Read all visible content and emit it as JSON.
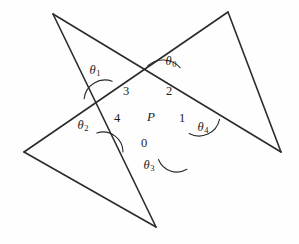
{
  "figure": {
    "kind": "pentagram-angle-diagram",
    "background_color": "#fefefe",
    "stroke_color": "#2b2b2b",
    "label_color": "#1c1c1c",
    "center": {
      "label": "P",
      "x": 151,
      "y": 116
    },
    "vertices": [
      {
        "name": "top-left-point",
        "x": 53,
        "y": 14
      },
      {
        "name": "top-right-point",
        "x": 228,
        "y": 12
      },
      {
        "name": "right-point",
        "x": 281,
        "y": 152
      },
      {
        "name": "bottom-point",
        "x": 156,
        "y": 227
      },
      {
        "name": "left-point",
        "x": 24,
        "y": 152
      }
    ],
    "edges": [
      {
        "name": "edge-topleft-to-right",
        "from": 0,
        "to": 2
      },
      {
        "name": "edge-right-to-topright",
        "from": 2,
        "to": 1
      },
      {
        "name": "edge-topright-to-left",
        "from": 1,
        "to": 4
      },
      {
        "name": "edge-left-to-bottom",
        "from": 4,
        "to": 3
      },
      {
        "name": "edge-bottom-to-topleft",
        "from": 3,
        "to": 0
      }
    ],
    "angle_arcs": [
      {
        "name": "arc-theta-0",
        "cx": 163,
        "cy": 83,
        "r": 23,
        "start_deg": 228,
        "end_deg": 318
      },
      {
        "name": "arc-theta-1",
        "cx": 105,
        "cy": 101,
        "r": 21,
        "start_deg": 186,
        "end_deg": 290
      },
      {
        "name": "arc-theta-2",
        "cx": 103,
        "cy": 152,
        "r": 20,
        "start_deg": 252,
        "end_deg": 360
      },
      {
        "name": "arc-theta-3",
        "cx": 177,
        "cy": 152,
        "r": 20,
        "start_deg": 60,
        "end_deg": 158
      },
      {
        "name": "arc-theta-4",
        "cx": 199,
        "cy": 115,
        "r": 21,
        "start_deg": 12,
        "end_deg": 118
      }
    ],
    "theta_labels": [
      {
        "name": "theta-0-label",
        "symbol": "θ",
        "subscript": "0",
        "x": 171,
        "y": 62
      },
      {
        "name": "theta-1-label",
        "symbol": "θ",
        "subscript": "1",
        "x": 95,
        "y": 71
      },
      {
        "name": "theta-2-label",
        "symbol": "θ",
        "subscript": "2",
        "x": 83,
        "y": 126
      },
      {
        "name": "theta-3-label",
        "symbol": "θ",
        "subscript": "3",
        "x": 149,
        "y": 166
      },
      {
        "name": "theta-4-label",
        "symbol": "θ",
        "subscript": "4",
        "x": 203,
        "y": 128
      }
    ],
    "region_labels": [
      {
        "name": "region-label-0",
        "text": "0",
        "x": 144,
        "y": 143
      },
      {
        "name": "region-label-1",
        "text": "1",
        "x": 182,
        "y": 118
      },
      {
        "name": "region-label-2",
        "text": "2",
        "x": 169,
        "y": 91
      },
      {
        "name": "region-label-3",
        "text": "3",
        "x": 126,
        "y": 91
      },
      {
        "name": "region-label-4",
        "text": "4",
        "x": 117,
        "y": 118
      }
    ]
  }
}
